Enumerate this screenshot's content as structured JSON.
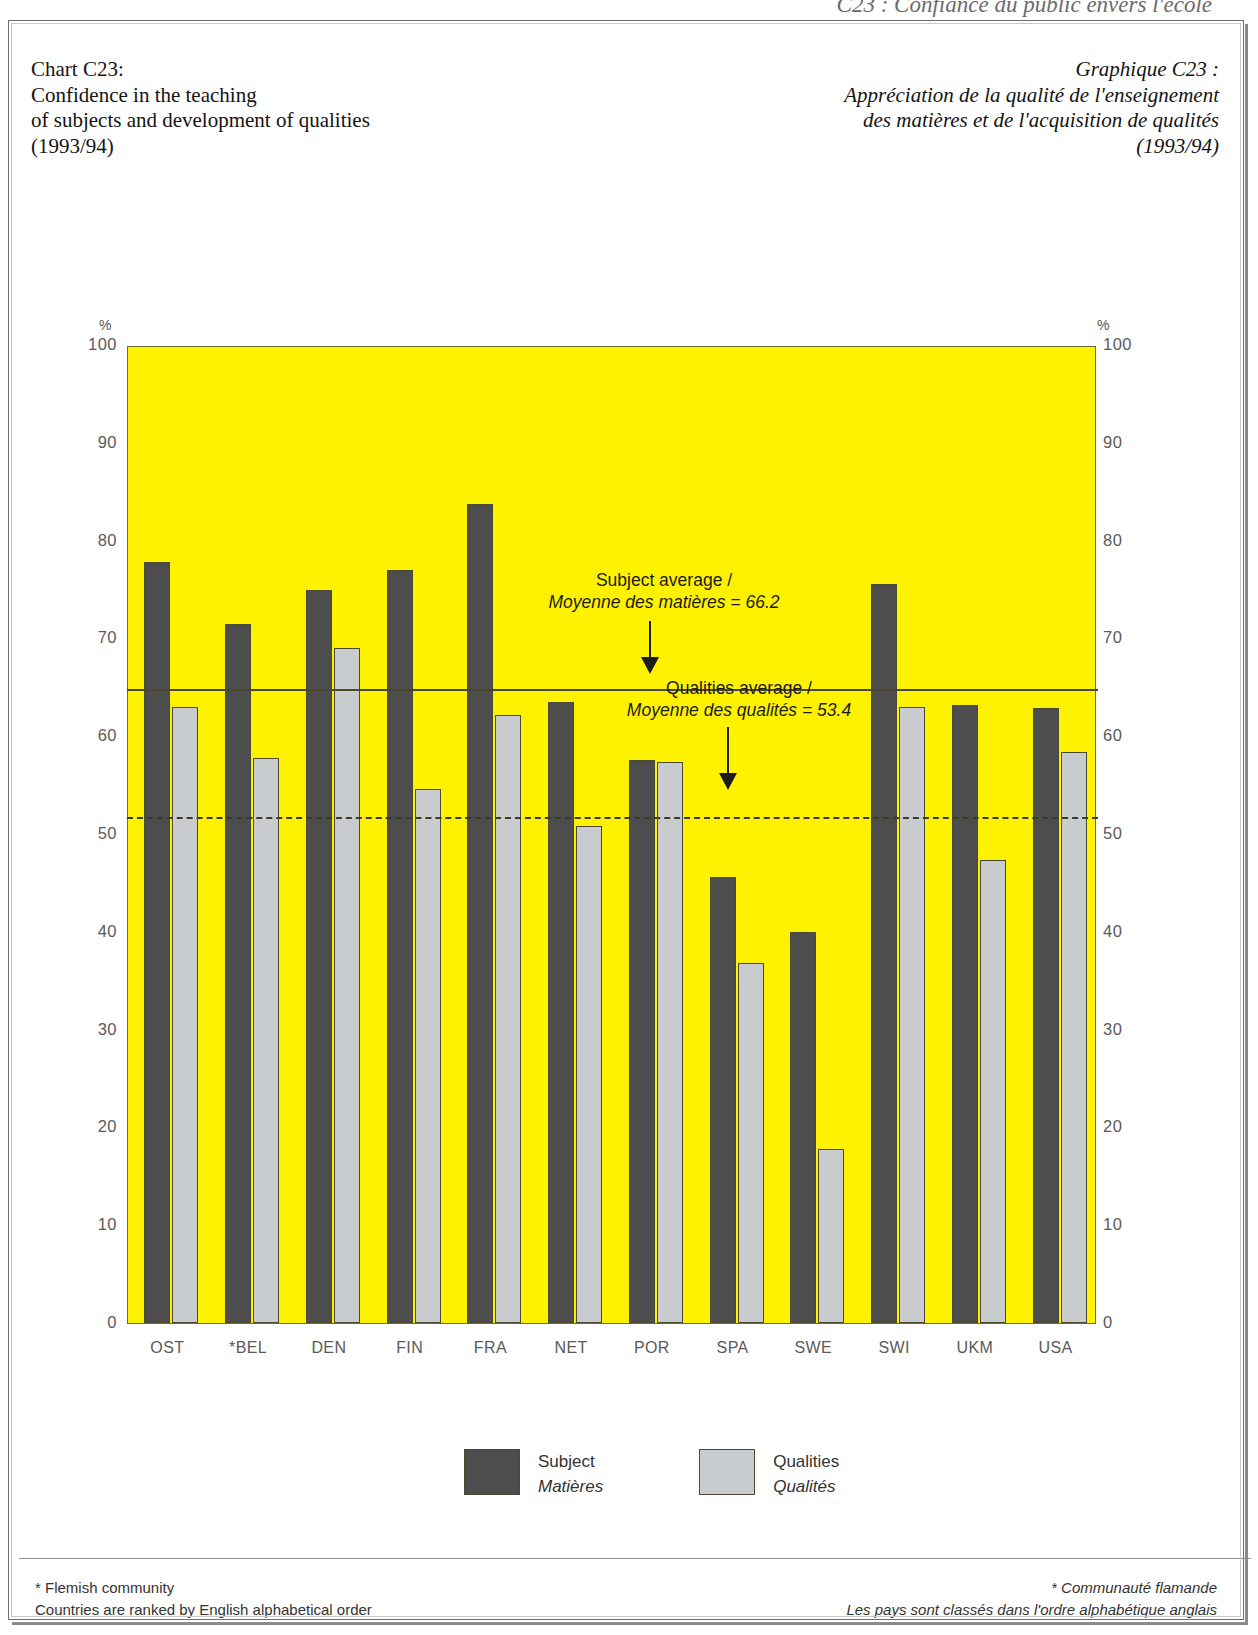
{
  "running_head": "C23 : Confiance du public envers l'école",
  "title_en": {
    "lines": [
      "Chart C23:",
      "Confidence in the teaching",
      "of subjects and development of qualities",
      "(1993/94)"
    ]
  },
  "title_fr": {
    "lines": [
      "Graphique C23 :",
      "Appréciation de la qualité de l'enseignement",
      "des matières et de l'acquisition de qualités",
      "(1993/94)"
    ]
  },
  "axis": {
    "unit_left": "%",
    "unit_right": "%",
    "ticks": [
      "100",
      "90",
      "80",
      "70",
      "60",
      "50",
      "40",
      "30",
      "20",
      "10",
      "0"
    ]
  },
  "annotations": {
    "subject_avg": {
      "line_en": "Subject average /",
      "line_fr": "Moyenne des matières = 66.2"
    },
    "qualities_avg": {
      "line_en": "Qualities average /",
      "line_fr": "Moyenne des qualités = 53.4"
    }
  },
  "legend": [
    {
      "key": "subject",
      "label_en": "Subject",
      "label_fr": "Matières",
      "color": "#4d4d4d"
    },
    {
      "key": "qualities",
      "label_en": "Qualities",
      "label_fr": "Qualités",
      "color": "#c8ccce"
    }
  ],
  "footnotes": {
    "en": [
      "* Flemish community",
      "Countries are ranked by English alphabetical order"
    ],
    "fr": [
      "* Communauté flamande",
      "Les pays sont classés dans l'ordre alphabétique anglais"
    ]
  },
  "colors": {
    "plot_background": "#FFF200",
    "subject": "#4d4d4d",
    "qualities": "#c8ccce",
    "axis": "#6d6a3a"
  },
  "chart_data": {
    "type": "bar",
    "title": "Confidence in the teaching of subjects and development of qualities (1993/94)",
    "title_fr": "Appréciation de la qualité de l'enseignement des matières et de l'acquisition de qualités (1993/94)",
    "xlabel": "",
    "ylabel": "%",
    "ylim": [
      0,
      100
    ],
    "yticks": [
      0,
      10,
      20,
      30,
      40,
      50,
      60,
      70,
      80,
      90,
      100
    ],
    "grid": false,
    "legend_position": "bottom",
    "categories": [
      "OST",
      "*BEL",
      "DEN",
      "FIN",
      "FRA",
      "NET",
      "POR",
      "SPA",
      "SWE",
      "SWI",
      "UKM",
      "USA"
    ],
    "series": [
      {
        "name": "Subject / Matières",
        "color": "#4d4d4d",
        "values": [
          77.8,
          71.5,
          74.9,
          77.0,
          83.7,
          63.5,
          57.6,
          45.6,
          40.0,
          75.6,
          63.2,
          62.9
        ]
      },
      {
        "name": "Qualities / Qualités",
        "color": "#c8ccce",
        "values": [
          63.0,
          57.8,
          69.0,
          54.6,
          62.2,
          50.8,
          57.4,
          36.8,
          17.8,
          63.0,
          47.3,
          58.4
        ]
      }
    ],
    "reference_lines": [
      {
        "label": "Subject average / Moyenne des matières",
        "value": 66.2,
        "drawn_at": 65.0,
        "style": "solid"
      },
      {
        "label": "Qualities average / Moyenne des qualités",
        "value": 53.4,
        "drawn_at": 51.9,
        "style": "dashed"
      }
    ]
  }
}
